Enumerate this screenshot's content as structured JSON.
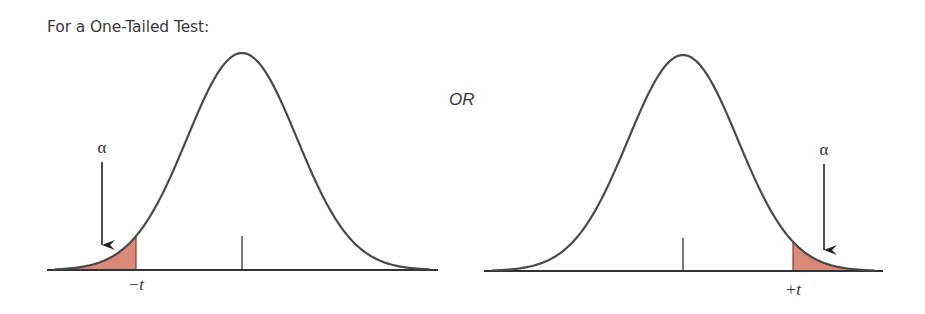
{
  "header": {
    "title": "For a One-Tailed Test:"
  },
  "separator_label": "OR",
  "colors": {
    "curve": "#4a4a4a",
    "baseline": "#333333",
    "tail_fill": "#d98a78",
    "tail_stroke": "#8a3a2a",
    "arrow": "#222222",
    "text": "#3a3a3a"
  },
  "panels": [
    {
      "id": "left-tail",
      "alpha_label": "α",
      "critical_label": "−t",
      "tail": "left",
      "center_x": 242,
      "peak_y": 53,
      "baseline_y": 270,
      "sigma": 55,
      "x_start": 47,
      "x_end": 438,
      "cutoff_x": 136,
      "tick_top_y": 236,
      "alpha_pos": {
        "x": 102,
        "y": 153
      },
      "arrow": {
        "x": 102,
        "y1": 162,
        "y2": 245
      },
      "critical_pos": {
        "x": 136,
        "y": 290
      }
    },
    {
      "id": "right-tail",
      "alpha_label": "α",
      "critical_label": "+t",
      "tail": "right",
      "center_x": 683,
      "peak_y": 55,
      "baseline_y": 271,
      "sigma": 55,
      "x_start": 484,
      "x_end": 883,
      "cutoff_x": 793,
      "tick_top_y": 238,
      "alpha_pos": {
        "x": 824,
        "y": 155
      },
      "arrow": {
        "x": 824,
        "y1": 164,
        "y2": 250
      },
      "critical_pos": {
        "x": 793,
        "y": 295
      }
    }
  ]
}
